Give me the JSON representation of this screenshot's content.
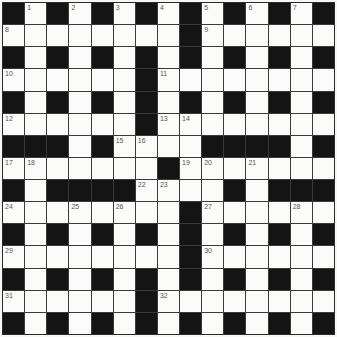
{
  "puzzle": {
    "type": "crossword",
    "size": 15,
    "colors": {
      "black": "#141414",
      "white": "#fbfbf9",
      "grid_line": "#3a3a3a",
      "number": "#555555"
    },
    "rows": [
      "#.#.#.#.#.#.#.#",
      "........#......",
      "#.#.#.#.#.#.#.#",
      "......#........",
      "#.#.#.#.#.#.#.#",
      "......#........",
      "###.#....####.#",
      ".......#.......",
      "#.####....#.###",
      "........#......",
      "#.#.#.#.#.#.#.#",
      "........#......",
      "#.#.#.#.#.#.#.#",
      "......#........",
      "#.#.#.#.#.#.#.#"
    ],
    "numbers": [
      {
        "r": 0,
        "c": 1,
        "n": "1"
      },
      {
        "r": 0,
        "c": 3,
        "n": "2"
      },
      {
        "r": 0,
        "c": 5,
        "n": "3"
      },
      {
        "r": 0,
        "c": 7,
        "n": "4"
      },
      {
        "r": 0,
        "c": 9,
        "n": "5"
      },
      {
        "r": 0,
        "c": 11,
        "n": "6"
      },
      {
        "r": 0,
        "c": 13,
        "n": "7"
      },
      {
        "r": 1,
        "c": 0,
        "n": "8"
      },
      {
        "r": 1,
        "c": 9,
        "n": "9"
      },
      {
        "r": 3,
        "c": 0,
        "n": "10"
      },
      {
        "r": 3,
        "c": 7,
        "n": "11"
      },
      {
        "r": 5,
        "c": 0,
        "n": "12"
      },
      {
        "r": 5,
        "c": 7,
        "n": "13"
      },
      {
        "r": 5,
        "c": 8,
        "n": "14"
      },
      {
        "r": 6,
        "c": 5,
        "n": "15"
      },
      {
        "r": 6,
        "c": 6,
        "n": "16"
      },
      {
        "r": 7,
        "c": 0,
        "n": "17"
      },
      {
        "r": 7,
        "c": 1,
        "n": "18"
      },
      {
        "r": 7,
        "c": 8,
        "n": "19"
      },
      {
        "r": 7,
        "c": 9,
        "n": "20"
      },
      {
        "r": 7,
        "c": 11,
        "n": "21"
      },
      {
        "r": 8,
        "c": 6,
        "n": "22"
      },
      {
        "r": 8,
        "c": 7,
        "n": "23"
      },
      {
        "r": 9,
        "c": 0,
        "n": "24"
      },
      {
        "r": 9,
        "c": 3,
        "n": "25"
      },
      {
        "r": 9,
        "c": 5,
        "n": "26"
      },
      {
        "r": 9,
        "c": 9,
        "n": "27"
      },
      {
        "r": 9,
        "c": 13,
        "n": "28"
      },
      {
        "r": 11,
        "c": 0,
        "n": "29"
      },
      {
        "r": 11,
        "c": 9,
        "n": "30"
      },
      {
        "r": 13,
        "c": 0,
        "n": "31"
      },
      {
        "r": 13,
        "c": 7,
        "n": "32"
      }
    ]
  }
}
